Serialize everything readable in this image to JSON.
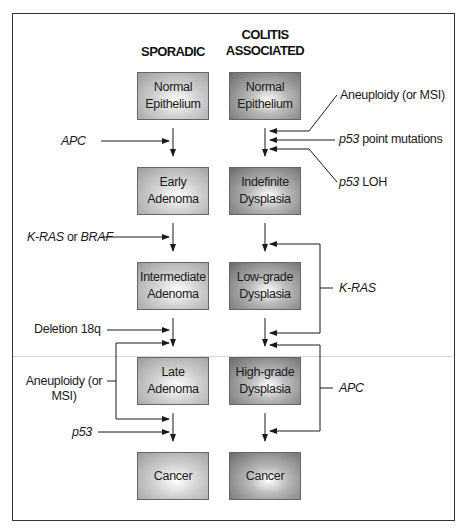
{
  "headers": {
    "sporadic": "SPORADIC",
    "colitis_line1": "COLITIS",
    "colitis_line2": "ASSOCIATED"
  },
  "sporadic_steps": [
    {
      "line1": "Normal",
      "line2": "Epithelium"
    },
    {
      "line1": "Early",
      "line2": "Adenoma"
    },
    {
      "line1": "Intermediate",
      "line2": "Adenoma"
    },
    {
      "line1": "Late",
      "line2": "Adenoma"
    },
    {
      "line1": "Cancer",
      "line2": ""
    }
  ],
  "colitis_steps": [
    {
      "line1": "Normal",
      "line2": "Epithelium"
    },
    {
      "line1": "Indefinite",
      "line2": "Dysplasia"
    },
    {
      "line1": "Low-grade",
      "line2": "Dysplasia"
    },
    {
      "line1": "High-grade",
      "line2": "Dysplasia"
    },
    {
      "line1": "Cancer",
      "line2": ""
    }
  ],
  "sporadic_events": {
    "apc": "APC",
    "kras_gene": "K-RAS",
    "kras_or": " or ",
    "braf_gene": "BRAF",
    "deletion": "Deletion 18q",
    "aneuploidy_line1": "Aneuploidy (or",
    "aneuploidy_line2": "MSI)",
    "p53": "p53"
  },
  "colitis_events": {
    "aneuploidy": "Aneuploidy (or MSI)",
    "p53_gene": "p53",
    "p53_point": " point mutations",
    "p53_loh_gene": "p53",
    "p53_loh": " LOH",
    "kras": "K-RAS",
    "apc": "APC"
  },
  "colors": {
    "sporadic_box_edge": "#9c9c9c",
    "colitis_box_edge": "#6a6a6a",
    "line": "#1a1a1a"
  }
}
